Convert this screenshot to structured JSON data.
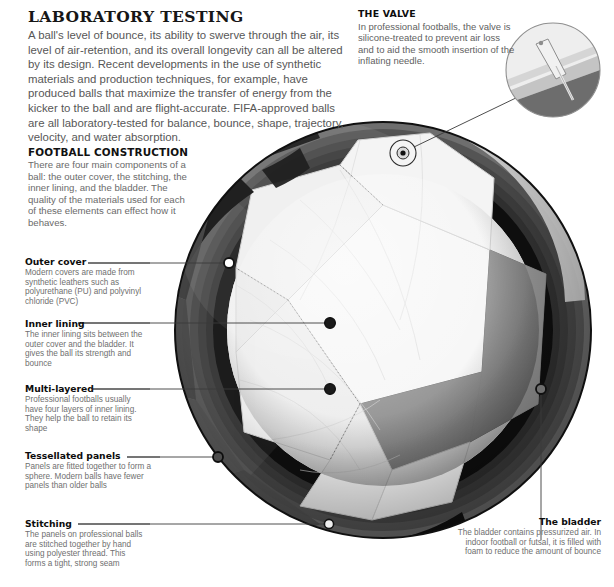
{
  "page": {
    "background": "#ffffff"
  },
  "laboratory": {
    "heading": "LABORATORY TESTING",
    "body": "A ball's level of bounce, its ability to swerve through the air, its level of air-retention, and its overall longevity can all be altered by its design. Recent developments in the use of synthetic materials and production techniques, for example, have produced balls that maximize the transfer of energy from the kicker to the ball and are flight-accurate. FIFA-approved balls are all laboratory-tested for balance, bounce, shape, trajectory, velocity, and water absorption."
  },
  "construction": {
    "heading": "FOOTBALL CONSTRUCTION",
    "body": "There are four main components of a ball: the outer cover, the stitching, the inner lining, and the bladder. The quality of the materials used for each of these elements can effect how it behaves."
  },
  "valve": {
    "heading": "THE VALVE",
    "body": "In professional footballs, the valve is silicone-treated to prevent air loss and to aid the smooth insertion of the inflating needle."
  },
  "bladder": {
    "heading": "The bladder",
    "body": "The bladder contains pressurized air. In indoor football or futsal, it is filled with foam to reduce the amount of bounce"
  },
  "callouts": [
    {
      "id": "outer-cover",
      "heading": "Outer cover",
      "body": "Modern covers are made from synthetic leathers such as polyurethane (PU) and polyvinyl chloride (PVC)"
    },
    {
      "id": "inner-lining",
      "heading": "Inner lining",
      "body": "The inner lining sits between the outer cover and the bladder. It gives the ball its strength and bounce"
    },
    {
      "id": "multi-layered",
      "heading": "Multi-layered",
      "body": "Professional footballs usually have four layers of inner lining. They help the ball to retain its shape"
    },
    {
      "id": "tessellated-panels",
      "heading": "Tessellated panels",
      "body": "Panels are fitted together to form a sphere. Modern balls have fewer panels than older balls"
    },
    {
      "id": "stitching",
      "heading": "Stitching",
      "body": "The panels on professional balls are stitched together by hand using polyester thread. This forms a tight, strong seam"
    }
  ],
  "colors": {
    "heading_text": "#111111",
    "body_text": "#6a6a6a",
    "serif_heading": "#161616",
    "leader_line": "#3a3a3a",
    "ball_outline": "#111111",
    "band_black": "#111111",
    "panel_white": "#f2f2f2",
    "panel_light": "#e4e4e4",
    "panel_mid": "#8c8c8c",
    "panel_dark": "#5e5e5e",
    "cut_dark": "#3c3c3c",
    "cut_darker": "#2a2a2a"
  },
  "illustration": {
    "ball": {
      "cx": 383,
      "cy": 330,
      "r": 208
    },
    "valve_marker": {
      "cx": 403,
      "cy": 153,
      "r": 13
    },
    "valve_detail_circle": {
      "cx": 553,
      "cy": 70,
      "r": 47
    },
    "leader_dots": [
      {
        "for": "outer-cover",
        "x": 229,
        "y": 263,
        "filled": false
      },
      {
        "for": "inner-lining",
        "x": 330,
        "y": 323,
        "filled": true
      },
      {
        "for": "multi-layered",
        "x": 330,
        "y": 389,
        "filled": true
      },
      {
        "for": "tessellated-panels",
        "x": 218,
        "y": 457,
        "filled": false
      },
      {
        "for": "stitching",
        "x": 329,
        "y": 524,
        "filled": false
      },
      {
        "for": "bladder",
        "x": 541,
        "y": 389,
        "filled": false
      }
    ]
  }
}
